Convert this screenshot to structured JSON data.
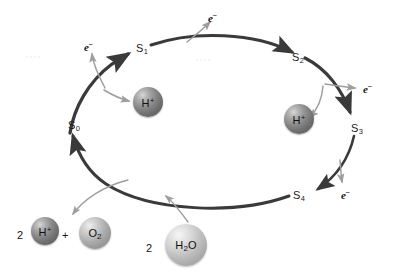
{
  "figure": {
    "type": "cycle-diagram",
    "width": 398,
    "height": 274,
    "background_color": "#ffffff",
    "cycle_arc_color": "#3a3a3a",
    "branch_arrow_color": "#9a9a9a",
    "label_color": "#1b1b1b",
    "direction": "clockwise"
  },
  "states": [
    {
      "id": "s0",
      "base": "S",
      "sub": "0",
      "label": "S0",
      "x": 68,
      "y": 120
    },
    {
      "id": "s1",
      "base": "S",
      "sub": "1",
      "label": "S1",
      "x": 136,
      "y": 43
    },
    {
      "id": "s2",
      "base": "S",
      "sub": "2",
      "label": "S2",
      "x": 292,
      "y": 52
    },
    {
      "id": "s3",
      "base": "S",
      "sub": "3",
      "label": "S3",
      "x": 351,
      "y": 123
    },
    {
      "id": "s4",
      "base": "S",
      "sub": "4",
      "label": "S4",
      "x": 293,
      "y": 190
    }
  ],
  "electrons": [
    {
      "id": "e-s0-s1",
      "base": "e",
      "sup": "−",
      "label": "e-",
      "x": 84,
      "y": 40
    },
    {
      "id": "e-s1-s2",
      "base": "e",
      "sup": "−",
      "label": "e-",
      "x": 208,
      "y": 11
    },
    {
      "id": "e-s2-s3",
      "base": "e",
      "sup": "−",
      "label": "e-",
      "x": 363,
      "y": 82
    },
    {
      "id": "e-s3-s4",
      "base": "e",
      "sup": "−",
      "label": "e-",
      "x": 341,
      "y": 188
    }
  ],
  "protons": [
    {
      "id": "h-left",
      "base": "H",
      "sup": "+",
      "label": "H+",
      "cx": 148,
      "cy": 102,
      "r": 15,
      "shade": "dark"
    },
    {
      "id": "h-right",
      "base": "H",
      "sup": "+",
      "label": "H+",
      "cx": 299,
      "cy": 119,
      "r": 15,
      "shade": "dark"
    }
  ],
  "products": {
    "coefficient": "2",
    "coefficient_x": 17,
    "coefficient_y": 230,
    "plus_sign": "+",
    "plus_x": 62,
    "plus_y": 230,
    "proton": {
      "base": "H",
      "sup": "+",
      "label": "H+",
      "cx": 45,
      "cy": 231,
      "r": 14,
      "shade": "dark"
    },
    "oxygen": {
      "base": "O",
      "sub": "2",
      "label": "O2",
      "cx": 95,
      "cy": 233,
      "r": 16,
      "shade": "mid"
    }
  },
  "reactant": {
    "coefficient": "2",
    "coefficient_x": 146,
    "coefficient_y": 243,
    "water": {
      "base": "H",
      "sub": "2",
      "tail": "O",
      "label": "H2O",
      "cx": 186,
      "cy": 245,
      "r": 21,
      "shade": "light"
    }
  },
  "connections": [
    {
      "from": "S0",
      "to": "S1",
      "kind": "cycle-arc"
    },
    {
      "from": "S1",
      "to": "S2",
      "kind": "cycle-arc"
    },
    {
      "from": "S2",
      "to": "S3",
      "kind": "cycle-arc"
    },
    {
      "from": "S3",
      "to": "S4",
      "kind": "cycle-arc"
    },
    {
      "from": "S4",
      "to": "S0",
      "kind": "cycle-arc"
    },
    {
      "from": "S0-S1 transition",
      "to": "e-",
      "kind": "release"
    },
    {
      "from": "S0-S1 transition",
      "to": "H+",
      "kind": "release"
    },
    {
      "from": "S1-S2 transition",
      "to": "e-",
      "kind": "release"
    },
    {
      "from": "S2-S3 transition",
      "to": "e-",
      "kind": "release"
    },
    {
      "from": "S2-S3 transition",
      "to": "H+",
      "kind": "release"
    },
    {
      "from": "S3-S4 transition",
      "to": "e-",
      "kind": "release"
    },
    {
      "from": "S4-S0 transition",
      "to": "2 H+ + O2",
      "kind": "release"
    },
    {
      "from": "2 H2O",
      "to": "S4-S0 transition",
      "kind": "input"
    }
  ]
}
